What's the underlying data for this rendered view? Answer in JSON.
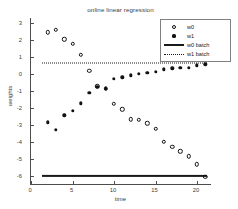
{
  "chart_data": {
    "type": "scatter",
    "title": "online linear regression",
    "xlabel": "time",
    "ylabel": "weights",
    "xlim": [
      0,
      21.8
    ],
    "ylim": [
      -6.55,
      3.3
    ],
    "xticks": [
      0,
      5,
      10,
      15,
      20
    ],
    "yticks": [
      3,
      2,
      1,
      0,
      -1,
      -2,
      -3,
      -4,
      -5,
      -6
    ],
    "grid": false,
    "legend_position": "upper right",
    "x": [
      2,
      3,
      4,
      5,
      6,
      7,
      8,
      9,
      10,
      11,
      12,
      13,
      14,
      15,
      16,
      17,
      18,
      19,
      20,
      21
    ],
    "series": [
      {
        "name": "w0",
        "marker": "open-circle",
        "values": [
          2.45,
          2.6,
          2.05,
          1.77,
          1.12,
          0.2,
          -0.72,
          -0.88,
          -1.75,
          -2.08,
          -2.68,
          -2.7,
          -2.92,
          -3.25,
          -4.0,
          -4.3,
          -4.57,
          -4.85,
          -5.32,
          -6.05
        ]
      },
      {
        "name": "w1",
        "marker": "filled-dot",
        "values": [
          -2.85,
          -3.3,
          -2.45,
          -2.18,
          -1.72,
          -1.12,
          -0.75,
          -0.85,
          -0.28,
          -0.2,
          -0.08,
          0.0,
          0.06,
          0.12,
          0.27,
          0.33,
          0.36,
          0.38,
          0.5,
          0.58
        ]
      }
    ],
    "reference_lines": [
      {
        "name": "w0 batch",
        "style": "solid",
        "value": -6.02
      },
      {
        "name": "w1 batch",
        "style": "dotted",
        "value": 0.63
      }
    ]
  },
  "legend": {
    "entries": [
      {
        "label": "w0",
        "symbol": "open-circle"
      },
      {
        "label": "w1",
        "symbol": "filled-dot"
      },
      {
        "label": "w0 batch",
        "symbol": "solid-line"
      },
      {
        "label": "w1 batch",
        "symbol": "dotted-line"
      }
    ]
  }
}
